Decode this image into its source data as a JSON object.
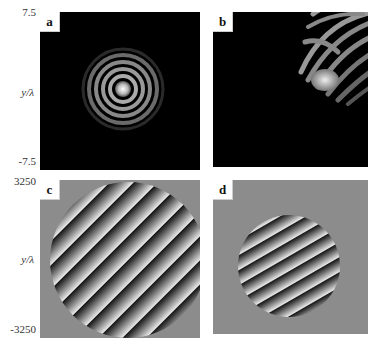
{
  "figure": {
    "panels": [
      {
        "id": "a",
        "label": "a",
        "description": "Circular diffraction pattern (Airy rings) centered in dark field"
      },
      {
        "id": "b",
        "label": "b",
        "description": "Off-center aberrated diffraction pattern in upper-right of dark field"
      },
      {
        "id": "c",
        "label": "c",
        "description": "Phase map: circular aperture with diagonal linear fringes on gray background"
      },
      {
        "id": "d",
        "label": "d",
        "description": "Phase map: smaller circular aperture with curved diagonal fringes on gray background"
      }
    ],
    "row1_axis": {
      "ylabel": "y/λ",
      "ytick_top": "7.5",
      "ytick_bottom": "-7.5"
    },
    "row2_axis": {
      "ylabel": "y/λ",
      "ytick_top": "3250",
      "ytick_bottom": "-3250"
    },
    "colors": {
      "dark_bg": "#000000",
      "gray_bg": "#8c8c8c",
      "page_bg": "#ffffff"
    }
  }
}
